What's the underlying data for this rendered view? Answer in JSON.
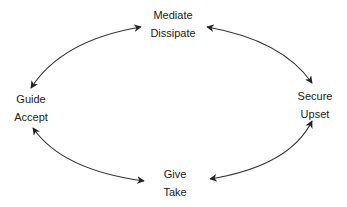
{
  "diagram": {
    "type": "cycle",
    "colors": {
      "text": "#1a1a1a",
      "arrow": "#222222",
      "background": "#ffffff"
    },
    "nodes": [
      {
        "id": "top",
        "lines": [
          "Mediate",
          "Dissipate"
        ]
      },
      {
        "id": "left",
        "lines": [
          "Guide",
          "Accept"
        ]
      },
      {
        "id": "right",
        "lines": [
          "Secure",
          "Upset"
        ]
      },
      {
        "id": "bottom",
        "lines": [
          "Give",
          "Take"
        ]
      }
    ],
    "edges": [
      {
        "from": "left",
        "to": "top",
        "direction": "bidirectional"
      },
      {
        "from": "top",
        "to": "right",
        "direction": "bidirectional"
      },
      {
        "from": "left",
        "to": "bottom",
        "direction": "bidirectional"
      },
      {
        "from": "bottom",
        "to": "right",
        "direction": "bidirectional"
      }
    ]
  }
}
